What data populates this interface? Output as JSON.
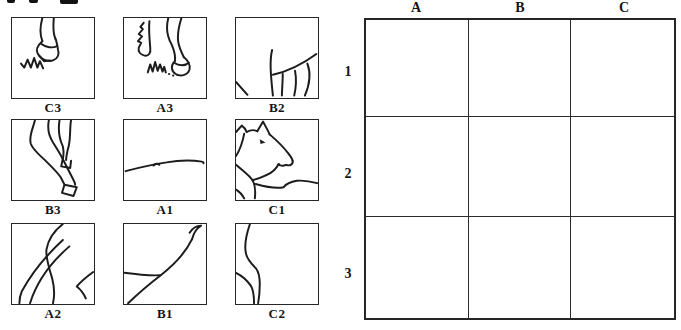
{
  "palette": {
    "background": "#ffffff",
    "ink": "#1c1c1c"
  },
  "pieces": [
    {
      "label": "C3",
      "drawing": "hoof-with-grass"
    },
    {
      "label": "A3",
      "drawing": "two-legs-with-grass"
    },
    {
      "label": "B2",
      "drawing": "belly-and-leg-tops"
    },
    {
      "label": "B3",
      "drawing": "crossed-legs-with-hoof"
    },
    {
      "label": "A1",
      "drawing": "back-line"
    },
    {
      "label": "C1",
      "drawing": "horse-head"
    },
    {
      "label": "A2",
      "drawing": "hindquarters-and-tail"
    },
    {
      "label": "B1",
      "drawing": "tail-tip"
    },
    {
      "label": "C2",
      "drawing": "front-leg-lines"
    }
  ],
  "grid": {
    "column_labels": [
      "A",
      "B",
      "C"
    ],
    "row_labels": [
      "1",
      "2",
      "3"
    ]
  }
}
